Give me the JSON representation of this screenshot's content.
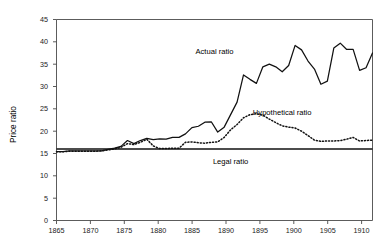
{
  "chart_data": {
    "type": "line",
    "title": "",
    "xlabel": "",
    "ylabel": "Price ratio",
    "xlim": [
      1865,
      1914
    ],
    "ylim": [
      0,
      45
    ],
    "grid": false,
    "legend_position": "inline-annotations",
    "x_ticks": [
      "1865",
      "1870",
      "1875",
      "1880",
      "1885",
      "1890",
      "1895",
      "1900",
      "1905",
      "1910"
    ],
    "x_tick_values": [
      1865,
      1870,
      1875,
      1880,
      1885,
      1890,
      1895,
      1900,
      1905,
      1910
    ],
    "y_ticks": [
      "0",
      "5",
      "10",
      "15",
      "20",
      "25",
      "30",
      "35",
      "40",
      "45"
    ],
    "y_tick_values": [
      0,
      5,
      10,
      15,
      20,
      25,
      30,
      35,
      40,
      45
    ],
    "x": [
      1865,
      1866,
      1867,
      1868,
      1869,
      1870,
      1871,
      1872,
      1873,
      1874,
      1875,
      1876,
      1877,
      1878,
      1879,
      1880,
      1881,
      1882,
      1883,
      1884,
      1885,
      1886,
      1887,
      1888,
      1889,
      1890,
      1891,
      1892,
      1893,
      1894,
      1895,
      1896,
      1897,
      1898,
      1899,
      1900,
      1901,
      1902,
      1903,
      1904,
      1905,
      1906,
      1907,
      1908,
      1909,
      1910,
      1911,
      1912,
      1913,
      1914
    ],
    "series": [
      {
        "name": "Actual ratio",
        "style": "solid",
        "color": "#111111",
        "label_text": "Actual ratio",
        "values": [
          15.4,
          15.4,
          15.6,
          15.6,
          15.6,
          15.6,
          15.6,
          15.6,
          15.9,
          16.2,
          16.6,
          17.9,
          17.2,
          17.9,
          18.4,
          18.1,
          18.3,
          18.2,
          18.6,
          18.6,
          19.4,
          20.8,
          21.1,
          22.0,
          22.1,
          19.8,
          20.9,
          23.7,
          26.5,
          32.6,
          31.6,
          30.7,
          34.4,
          35.0,
          34.4,
          33.3,
          34.7,
          39.2,
          38.2,
          35.7,
          33.9,
          30.5,
          31.2,
          38.6,
          39.7,
          38.3,
          38.3,
          33.6,
          34.2,
          37.5
        ]
      },
      {
        "name": "Hypothetical ratio",
        "style": "dotted",
        "color": "#111111",
        "label_text": "Hypothetical ratio",
        "values": [
          15.4,
          15.4,
          15.5,
          15.5,
          15.5,
          15.5,
          15.5,
          15.6,
          15.8,
          16.0,
          16.4,
          17.2,
          17.0,
          17.5,
          18.2,
          16.7,
          16.1,
          16.1,
          16.2,
          16.2,
          17.5,
          17.6,
          17.4,
          17.3,
          17.5,
          17.6,
          18.6,
          20.3,
          21.5,
          23.0,
          23.7,
          23.9,
          23.6,
          22.7,
          21.9,
          21.2,
          20.9,
          20.7,
          20.0,
          19.0,
          18.0,
          17.7,
          17.8,
          17.8,
          17.9,
          18.2,
          18.6,
          17.8,
          17.9,
          18.0
        ]
      },
      {
        "name": "Legal ratio",
        "style": "solid-flat",
        "color": "#111111",
        "label_text": "Legal ratio",
        "values": [
          16.0,
          16.0,
          16.0,
          16.0,
          16.0,
          16.0,
          16.0,
          16.0,
          16.0,
          16.0,
          16.0,
          16.0,
          16.0,
          16.0,
          16.0,
          16.0,
          16.0,
          16.0,
          16.0,
          16.0,
          16.0,
          16.0,
          16.0,
          16.0,
          16.0,
          16.0,
          16.0,
          16.0,
          16.0,
          16.0,
          16.0,
          16.0,
          16.0,
          16.0,
          16.0,
          16.0,
          16.0,
          16.0,
          16.0,
          16.0,
          16.0,
          16.0,
          16.0,
          16.0,
          16.0,
          16.0,
          16.0,
          16.0,
          16.0,
          16.0
        ]
      }
    ],
    "annotations": [
      {
        "text": "Actual ratio",
        "x": 1889.5,
        "y": 37.2
      },
      {
        "text": "Hypothetical ratio",
        "x": 1900.0,
        "y": 23.6
      },
      {
        "text": "Legal ratio",
        "x": 1892.0,
        "y": 12.6
      }
    ]
  }
}
